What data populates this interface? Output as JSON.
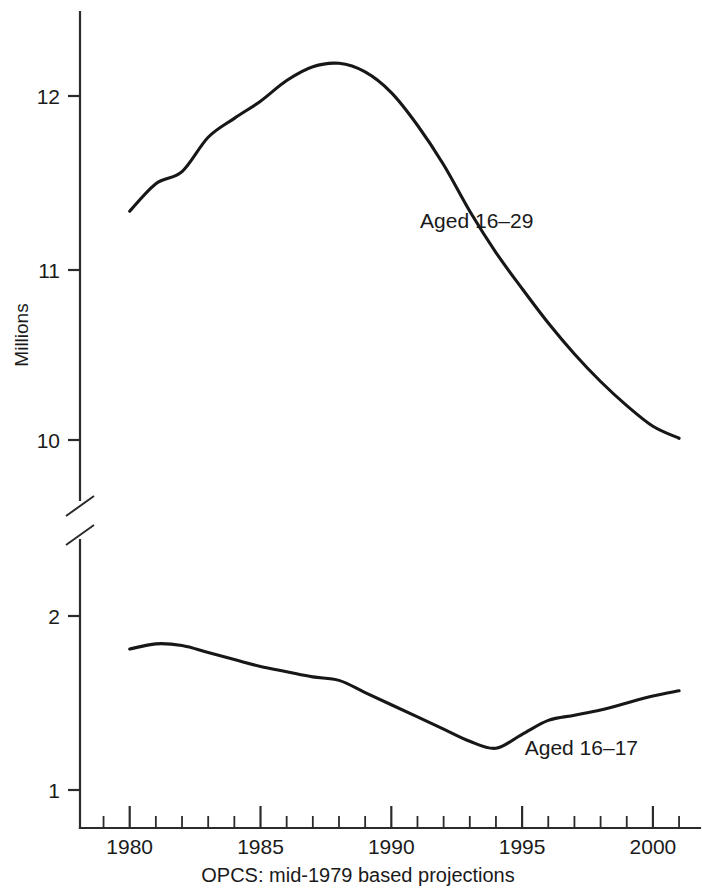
{
  "chart_data": {
    "type": "line",
    "title": "",
    "subtitle": "",
    "xlabel": "",
    "ylabel": "Millions",
    "source_note": "OPCS: mid-1979 based projections",
    "grid": false,
    "legend_position": "inline-annotation",
    "broken_axis": true,
    "axis_break_note": "Y axis is broken between the upper panel (10–12 millions) and the lower panel (1–2 millions)",
    "x": [
      1980,
      1981,
      1982,
      1983,
      1984,
      1985,
      1986,
      1987,
      1988,
      1989,
      1990,
      1991,
      1992,
      1993,
      1994,
      1995,
      1996,
      1997,
      1998,
      1999,
      2000,
      2001
    ],
    "xlim": [
      1978.1,
      2001.8
    ],
    "x_major_ticks": [
      1980,
      1985,
      1990,
      1995,
      2000
    ],
    "x_major_tick_labels": [
      "1980",
      "1985",
      "1990",
      "1995",
      "2000"
    ],
    "x_minor_tick_step": 1,
    "panels": [
      {
        "name": "upper",
        "ylim": [
          9.55,
          12.45
        ],
        "y_ticks": [
          10,
          11,
          12
        ],
        "y_tick_labels": [
          "10",
          "11",
          "12"
        ]
      },
      {
        "name": "lower",
        "ylim": [
          0.78,
          2.35
        ],
        "y_ticks": [
          1,
          2
        ],
        "y_tick_labels": [
          "1",
          "2"
        ]
      }
    ],
    "series": [
      {
        "name": "Aged 16–29",
        "panel": "upper",
        "label": "Aged 16–29",
        "label_x": 1991.1,
        "label_y": 11.23,
        "color": "#17171a",
        "values": [
          11.33,
          11.49,
          11.56,
          11.76,
          11.87,
          11.97,
          12.09,
          12.17,
          12.19,
          12.14,
          12.02,
          11.83,
          11.6,
          11.33,
          11.09,
          10.88,
          10.68,
          10.5,
          10.34,
          10.2,
          10.08,
          10.01
        ]
      },
      {
        "name": "Aged 16–17",
        "panel": "lower",
        "label": "Aged 16–17",
        "label_x": 1995.1,
        "label_y": 1.2,
        "color": "#17171a",
        "values": [
          1.81,
          1.84,
          1.83,
          1.79,
          1.75,
          1.71,
          1.68,
          1.65,
          1.63,
          1.56,
          1.49,
          1.42,
          1.35,
          1.28,
          1.24,
          1.32,
          1.4,
          1.43,
          1.46,
          1.5,
          1.54,
          1.57
        ]
      }
    ]
  },
  "axis": {
    "y_title": "Millions"
  }
}
